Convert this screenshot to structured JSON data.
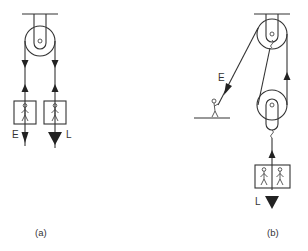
{
  "figure": {
    "panels": [
      {
        "id": "a",
        "caption": "(a)",
        "description": "Single fixed pulley: effort E and load L each hang from one side of the rope",
        "labels": {
          "effort": "E",
          "load": "L"
        },
        "load_people": 1,
        "effort_people": 1
      },
      {
        "id": "b",
        "caption": "(b)",
        "description": "Fixed pulley plus movable pulley: person on ground pulls rope E; load L of two people hangs from movable pulley",
        "labels": {
          "effort": "E",
          "load": "L"
        },
        "load_people": 2
      }
    ]
  }
}
